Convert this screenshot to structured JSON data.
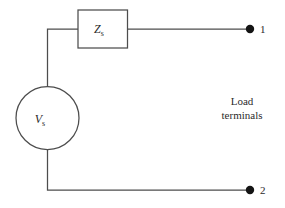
{
  "diagram": {
    "background_color": "#ffffff",
    "line_color": "#4d4d4d",
    "dot_color": "#141414",
    "text_color": "#2b2b2b"
  },
  "source": {
    "symbol_type": "circle",
    "label_main": "V",
    "label_sub": "s"
  },
  "impedance": {
    "symbol_type": "rectangle",
    "label_main": "Z",
    "label_sub": "s"
  },
  "terminals": [
    {
      "name": "terminal-1",
      "label": "1"
    },
    {
      "name": "terminal-2",
      "label": "2"
    }
  ],
  "annotation": {
    "line1": "Load",
    "line2": "terminals"
  }
}
